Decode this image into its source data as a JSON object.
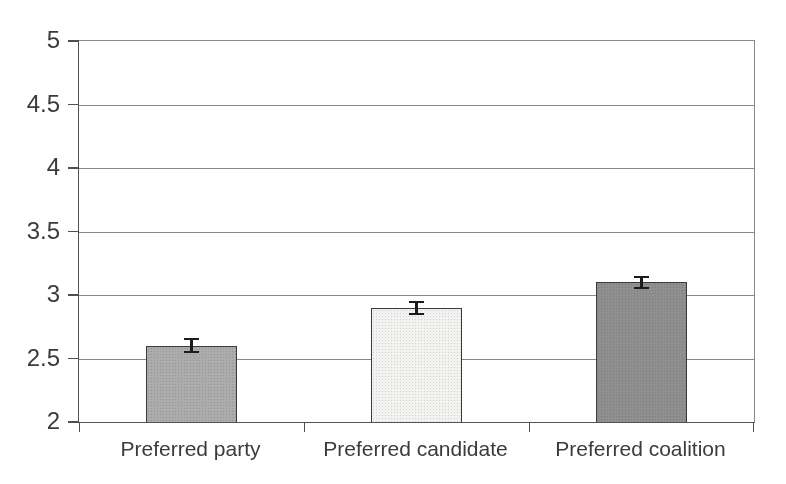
{
  "chart_data": {
    "type": "bar",
    "categories": [
      "Preferred party",
      "Preferred candidate",
      "Preferred coalition"
    ],
    "values": [
      2.6,
      2.9,
      3.1
    ],
    "error_bars": [
      0.06,
      0.055,
      0.05
    ],
    "ylim": [
      2,
      5
    ],
    "ytick_step": 0.5,
    "ytick_labels": [
      "2",
      "2.5",
      "3",
      "3.5",
      "4",
      "4.5",
      "5"
    ],
    "grid": true,
    "legend": false,
    "bar_colors": [
      "#acacac",
      "#f2f2f0",
      "#8f8f8f"
    ],
    "bar_border_color": "#3a3a3a",
    "gridline_color": "#888888",
    "axis_color": "#4f4f4f",
    "error_bar_color": "#1c1c1c",
    "text_color": "#3b3b3b",
    "background": "#ffffff"
  }
}
